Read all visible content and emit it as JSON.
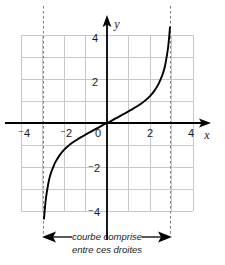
{
  "figure": {
    "title": "",
    "caption_line1": "courbe comprise",
    "caption_line2": "entre ces droites",
    "axis_x_label": "x",
    "axis_y_label": "y",
    "colors": {
      "curve": "#000000",
      "axis": "#000000",
      "grid": "#c8c8c8",
      "asymptote": "#808080",
      "text": "#1a1a1a",
      "background": "#ffffff"
    }
  },
  "chart_data": {
    "type": "line",
    "title": "",
    "xlabel": "x",
    "ylabel": "y",
    "xlim": [
      -4,
      4
    ],
    "ylim": [
      -4,
      4
    ],
    "grid": true,
    "legend": "none",
    "x_ticks": [
      -4,
      -2,
      0,
      2,
      4
    ],
    "x_tick_labels": [
      "⁻4",
      "⁻2",
      "0",
      "2",
      "4"
    ],
    "y_ticks": [
      4,
      2,
      0,
      -2,
      -4
    ],
    "y_tick_labels": [
      "4",
      "2",
      "0",
      "⁻2",
      "⁻4"
    ],
    "x_tick_labels_shown": [
      "⁻4",
      "⁻2",
      "2",
      "4"
    ],
    "y_tick_labels_shown": [
      "4",
      "2",
      "⁻2",
      "⁻4"
    ],
    "origin_label": "0",
    "grid_step": 1,
    "asymptotes": [
      -3,
      3
    ],
    "asymptote_style": "dashed",
    "series": [
      {
        "name": "courbe",
        "description": "odd increasing curve through origin with vertical asymptotes at x = -3 and x = 3",
        "x": [
          -2.93,
          -2.9,
          -2.85,
          -2.8,
          -2.7,
          -2.6,
          -2.5,
          -2.4,
          -2.2,
          -2.0,
          -1.8,
          -1.6,
          -1.4,
          -1.2,
          -1.0,
          -0.8,
          -0.6,
          -0.4,
          -0.2,
          0.0,
          0.2,
          0.4,
          0.6,
          0.8,
          1.0,
          1.2,
          1.4,
          1.6,
          1.8,
          2.0,
          2.2,
          2.4,
          2.5,
          2.6,
          2.7,
          2.8,
          2.85,
          2.9,
          2.93
        ],
        "y": [
          -4.35,
          -4.0,
          -3.5,
          -3.15,
          -2.6,
          -2.25,
          -2.0,
          -1.78,
          -1.46,
          -1.22,
          -1.04,
          -0.89,
          -0.76,
          -0.64,
          -0.53,
          -0.42,
          -0.31,
          -0.21,
          -0.1,
          0.0,
          0.1,
          0.21,
          0.31,
          0.42,
          0.53,
          0.64,
          0.76,
          0.89,
          1.04,
          1.22,
          1.46,
          1.78,
          2.0,
          2.25,
          2.6,
          3.15,
          3.5,
          4.0,
          4.35
        ]
      }
    ],
    "annotations": [
      {
        "name": "range-marker",
        "text_line1": "courbe comprise",
        "text_line2": "entre ces droites",
        "arrow": "double-headed",
        "from_x": -3,
        "to_x": 3
      }
    ]
  }
}
